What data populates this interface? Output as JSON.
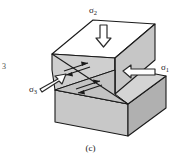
{
  "figure": {
    "caption": "(c)",
    "edge_marker": "3",
    "background_color": "#ffffff",
    "line_color": "#1a1a1a",
    "face_fill_top": "#ffffff",
    "face_fill_light": "#d6d6d6",
    "face_fill_mid": "#c2c2c2",
    "face_fill_dark": "#b0b0b0",
    "arrow_outline_color": "#2b2b2b",
    "arrow_fill_color": "#ffffff"
  },
  "labels": {
    "sigma2": {
      "symbol": "σ",
      "subscript": "2"
    },
    "sigma1": {
      "symbol": "σ",
      "subscript": "1"
    },
    "sigma3": {
      "symbol": "σ",
      "subscript": "3"
    }
  },
  "stress_arrows": [
    {
      "name": "sigma2-arrow",
      "label": "σ2",
      "direction": "down",
      "style": "hollow-outline",
      "description": "vertical maximum compressive stress applied to top face"
    },
    {
      "name": "sigma1-arrow",
      "label": "σ1",
      "direction": "left",
      "style": "hollow-outline",
      "description": "horizontal stress applied to right face"
    },
    {
      "name": "sigma3-arrow",
      "label": "σ3",
      "direction": "up-right",
      "style": "hollow-outline",
      "description": "horizontal least stress applied to left front face"
    }
  ],
  "shear_markers": [
    {
      "name": "shear-arrow-pair-upper",
      "sense": "dextral",
      "description": "paired half arrows on fault plane upper position"
    },
    {
      "name": "shear-arrow-pair-lower",
      "sense": "dextral",
      "description": "paired half arrows on fault plane lower position"
    }
  ],
  "geometry": {
    "description": "rectangular block offset along an inclined planar fault separating an upper hanging block from a lower footwall block"
  }
}
